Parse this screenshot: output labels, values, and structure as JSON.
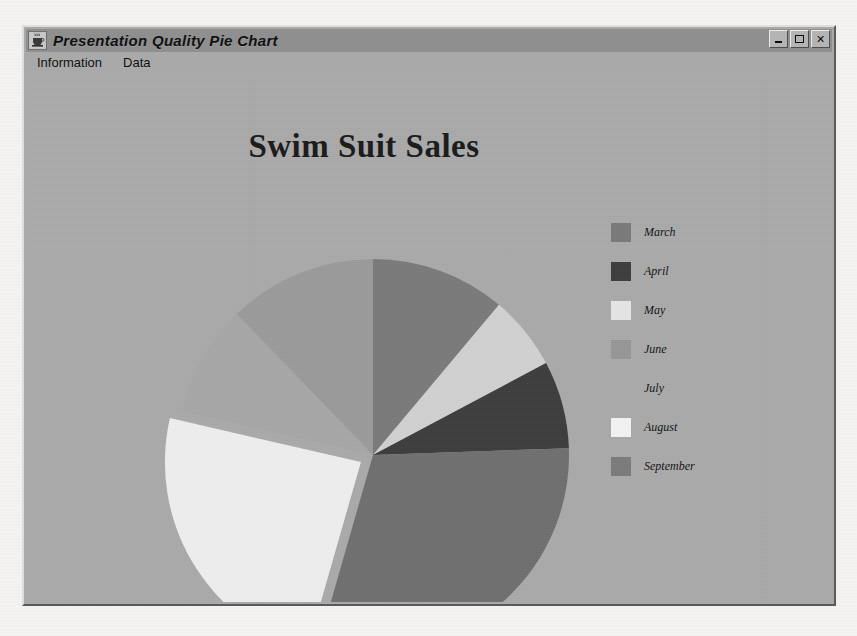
{
  "window": {
    "title": "Presentation Quality Pie Chart",
    "icon": "java-coffee-cup-icon",
    "buttons": {
      "minimize": "_",
      "maximize": "□",
      "close": "×"
    }
  },
  "menu": {
    "items": [
      {
        "label": "Information"
      },
      {
        "label": "Data"
      }
    ]
  },
  "colors": {
    "window_background": "#a9a9a9",
    "title_bar": "#8f8f8f",
    "page_background": "#f4f3f1",
    "title_text": "#1b1b1b"
  },
  "chart_data": {
    "type": "pie",
    "title": "Swim Suit Sales",
    "xlabel": "",
    "ylabel": "",
    "legend_position": "right",
    "grid": false,
    "categories": [
      "March",
      "April",
      "May",
      "June",
      "July",
      "August",
      "September"
    ],
    "values": [
      11,
      7,
      6,
      13,
      9,
      24,
      30
    ],
    "slices": [
      {
        "label": "March",
        "value": 11,
        "color": "#7a7a7a",
        "start_angle": 0,
        "end_angle": 40,
        "exploded": false
      },
      {
        "label": "May",
        "value": 6,
        "color": "#d0d0d0",
        "start_angle": 40,
        "end_angle": 62,
        "exploded": false
      },
      {
        "label": "April",
        "value": 7,
        "color": "#3d3d3d",
        "start_angle": 62,
        "end_angle": 88,
        "exploded": false
      },
      {
        "label": "September",
        "value": 30,
        "color": "#6f6f6f",
        "start_angle": 88,
        "end_angle": 196,
        "exploded": false
      },
      {
        "label": "August",
        "value": 24,
        "color": "#ededed",
        "start_angle": 196,
        "end_angle": 283,
        "exploded": true
      },
      {
        "label": "July",
        "value": 9,
        "color": "#a6a6a6",
        "start_angle": 283,
        "end_angle": 316,
        "exploded": false
      },
      {
        "label": "June",
        "value": 13,
        "color": "#9a9a9a",
        "start_angle": 316,
        "end_angle": 360,
        "exploded": false
      }
    ],
    "legend": [
      {
        "label": "March",
        "color": "#7a7a7a"
      },
      {
        "label": "April",
        "color": "#3d3d3d"
      },
      {
        "label": "May",
        "color": "#e4e4e4"
      },
      {
        "label": "June",
        "color": "#969696"
      },
      {
        "label": "July",
        "color": "#a9a9a9"
      },
      {
        "label": "August",
        "color": "#f2f2f2"
      },
      {
        "label": "September",
        "color": "#7b7b7b"
      }
    ],
    "center": {
      "x": 347,
      "y": 382
    },
    "radius": 196
  }
}
